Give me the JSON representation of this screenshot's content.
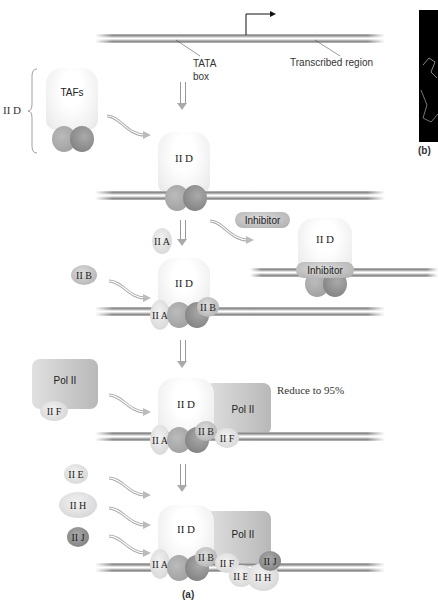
{
  "figure": {
    "panel_a_label": "(a)",
    "panel_b_label": "(b)"
  },
  "top_dna": {
    "tata_label_line1": "TATA",
    "tata_label_line2": "box",
    "transcribed_label": "Transcribed region"
  },
  "step1": {
    "bracket_label": "II D",
    "tafs_label": "TAFs"
  },
  "step2": {
    "tfiid_label": "II D"
  },
  "inhibitor_branch": {
    "inhibitor_free_label": "Inhibitor",
    "tfiid_label": "II D",
    "inhibitor_bound_label": "Inhibitor"
  },
  "step3": {
    "iia_free_label": "II A",
    "iib_free_label": "II B",
    "tfiid_label": "II D",
    "iia_bound_label": "II A",
    "iib_bound_label": "II B"
  },
  "step4": {
    "pol_free_label": "Pol II",
    "iif_free_label": "II F",
    "tfiid_label": "II D",
    "pol_bound_label": "Pol II",
    "iia_label": "II A",
    "iib_label": "II B",
    "iif_label": "II F",
    "annotation": "Reduce to 95%"
  },
  "step5": {
    "iie_free_label": "II E",
    "iih_free_label": "II H",
    "iij_free_label": "II J",
    "tfiid_label": "II D",
    "pol_label": "Pol II",
    "iia_label": "II A",
    "iib_label": "II B",
    "iif_label": "II F",
    "iie_label": "II E",
    "iih_label": "II H",
    "iij_label": "II J"
  }
}
